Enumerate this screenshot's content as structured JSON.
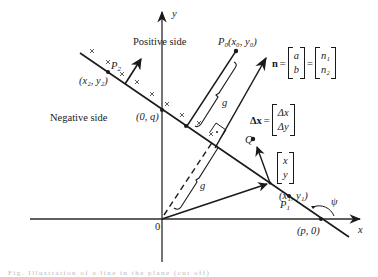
{
  "figure": {
    "axes": {
      "x_label": "x",
      "y_label": "y",
      "origin_label": "0"
    },
    "regions": {
      "positive_side": "Positive side",
      "negative_side": "Negative side"
    },
    "points": {
      "y_intercept": "(0, q)",
      "x_intercept": "(p, 0)",
      "p0_name": "P",
      "p0_sub": "0",
      "p0_coords": "(x₀, y₀)",
      "p1_name": "P",
      "p1_sub": "1",
      "p1_coords": "(x₁, y₁)",
      "p2_name": "P",
      "p2_sub": "2",
      "p2_coords": "(x₂, y₂)",
      "q_name": "Q"
    },
    "distance_label": "g",
    "angle_label": "ψ",
    "normal_vector": {
      "name": "n",
      "equals": "=",
      "col1": [
        "a",
        "b"
      ],
      "col2": [
        "n₁",
        "n₂"
      ]
    },
    "delta_vector": {
      "name": "Δx",
      "equals": "=",
      "col": [
        "Δx",
        "Δy"
      ]
    },
    "position_vector": {
      "col": [
        "x",
        "y"
      ]
    },
    "caption": "Fig. Illustration of a line in the plane (cut off)"
  }
}
